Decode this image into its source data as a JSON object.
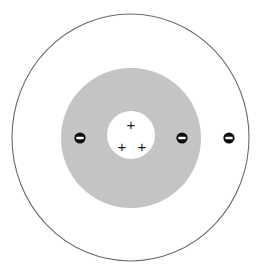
{
  "figure": {
    "background_color": "#ffffff",
    "canvas": {
      "width": 261,
      "height": 269
    }
  },
  "chart_data": {
    "type": "diagram",
    "subtitle": "",
    "xlabel": "",
    "ylabel": "",
    "legend": [],
    "annotations": [],
    "shells": [
      {
        "name": "outer-shell-ring",
        "label": "outer electron shell",
        "shape": "ellipse",
        "cx": 130.5,
        "cy": 137.5,
        "rx": 118.5,
        "ry": 123.5,
        "fill": "#ffffff",
        "stroke": "#6b6b6b",
        "stroke_width": 1.1,
        "electron_count": 1
      },
      {
        "name": "inner-shell-disk",
        "label": "inner electron shell",
        "shape": "circle",
        "cx": 131,
        "cy": 138,
        "r": 70,
        "fill": "#c4c4c4",
        "stroke": "none",
        "electron_count": 2
      }
    ],
    "nucleus": {
      "name": "nucleus",
      "label": "nucleus",
      "shape": "circle",
      "cx": 131,
      "cy": 135,
      "r": 24,
      "fill": "#ffffff",
      "proton_count": 3,
      "protons": [
        {
          "symbol": "+",
          "cx": 131,
          "cy": 124
        },
        {
          "symbol": "+",
          "cx": 122,
          "cy": 146
        },
        {
          "symbol": "+",
          "cx": 142,
          "cy": 146
        }
      ]
    },
    "electrons": {
      "count": 3,
      "symbol": "−",
      "radius": 5.6,
      "fill": "#0d0d0d",
      "sign_fill": "#ffffff",
      "items": [
        {
          "label": "electron-inner-left",
          "shell": "inner-shell-disk",
          "cx": 80,
          "cy": 138
        },
        {
          "label": "electron-inner-right",
          "shell": "inner-shell-disk",
          "cx": 182,
          "cy": 138
        },
        {
          "label": "electron-outer-right",
          "shell": "outer-shell-ring",
          "cx": 229,
          "cy": 138
        }
      ]
    },
    "counts": {
      "protons": 3,
      "electrons": 3,
      "shells": 2
    }
  }
}
